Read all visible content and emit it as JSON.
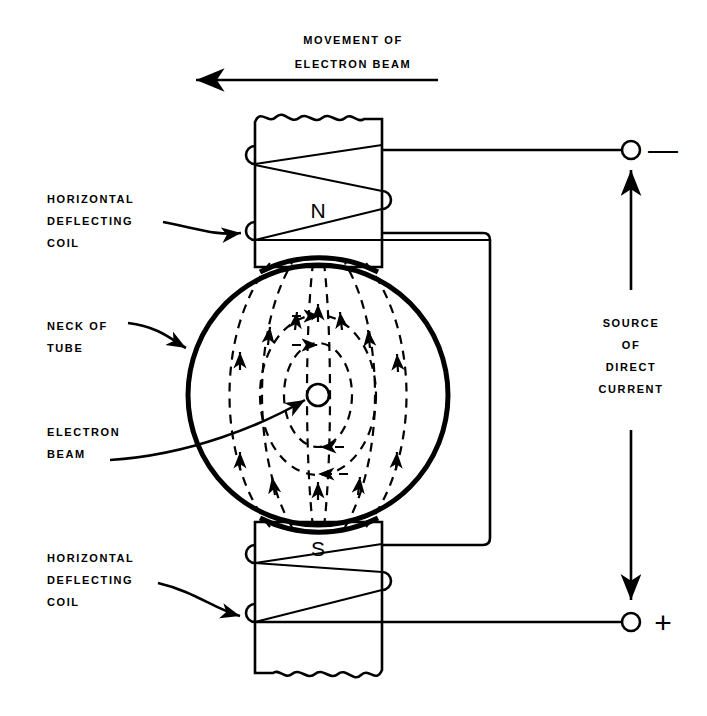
{
  "figure": {
    "title_line1": "MOVEMENT  OF",
    "title_line2": "ELECTRON BEAM",
    "labels": {
      "coil_top": [
        "HORIZONTAL",
        "DEFLECTING",
        "COIL"
      ],
      "coil_bottom": [
        "HORIZONTAL",
        "DEFLECTING",
        "COIL"
      ],
      "neck": [
        "NECK OF",
        "TUBE"
      ],
      "beam": [
        "ELECTRON",
        "BEAM"
      ],
      "source": [
        "SOURCE",
        "OF",
        "DIRECT",
        "CURRENT"
      ]
    },
    "poles": {
      "north": "N",
      "south": "S"
    },
    "terminals": {
      "negative": "—",
      "positive": "+"
    },
    "colors": {
      "ink": "#000000",
      "paper": "#ffffff"
    },
    "icons": {
      "beam_direction": "arrow-left-icon",
      "current_up": "arrow-up-icon",
      "current_down": "arrow-down-icon",
      "field_flow": "arrow-icon"
    }
  }
}
